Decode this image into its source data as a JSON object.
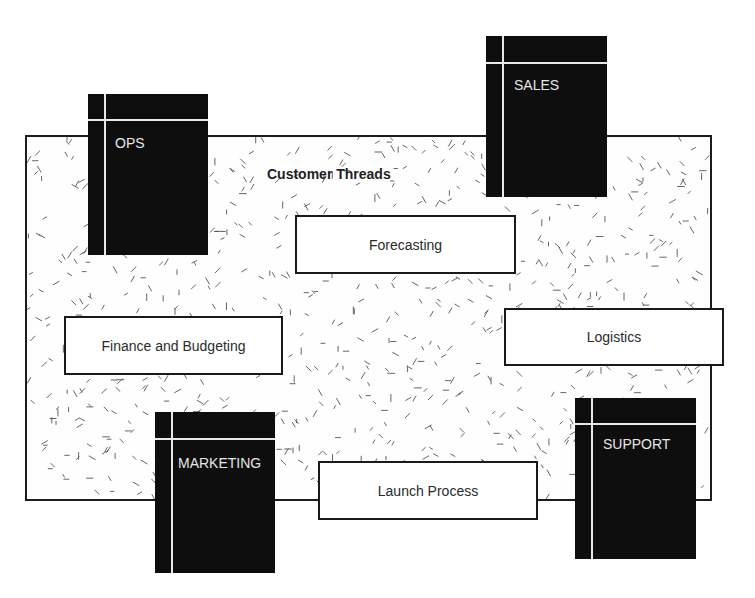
{
  "diagram": {
    "title": "Customer Threads",
    "colors": {
      "frame_border": "#1c1c1c",
      "department_fill": "#0e0e0e",
      "department_text": "#e6e6e6",
      "process_border": "#1a1a1a",
      "texture_stroke": "#555555"
    },
    "departments": [
      {
        "id": "ops",
        "label": "OPS"
      },
      {
        "id": "sales",
        "label": "SALES"
      },
      {
        "id": "marketing",
        "label": "MARKETING"
      },
      {
        "id": "support",
        "label": "SUPPORT"
      }
    ],
    "processes": [
      {
        "id": "forecasting",
        "label": "Forecasting"
      },
      {
        "id": "finance",
        "label": "Finance and Budgeting"
      },
      {
        "id": "logistics",
        "label": "Logistics"
      },
      {
        "id": "launch",
        "label": "Launch Process"
      }
    ]
  }
}
